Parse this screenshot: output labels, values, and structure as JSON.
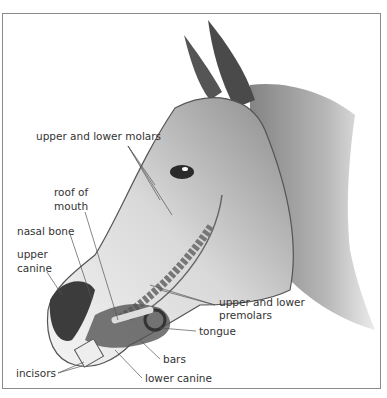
{
  "figure": {
    "labels": {
      "molars": "upper and lower molars",
      "roof_line1": "roof of",
      "roof_line2": "mouth",
      "nasal_bone": "nasal bone",
      "upper_canine_line1": "upper",
      "upper_canine_line2": "canine",
      "premolars_line1": "upper and lower",
      "premolars_line2": "premolars",
      "tongue": "tongue",
      "bars": "bars",
      "incisors": "incisors",
      "lower_canine": "lower canine"
    },
    "colors": {
      "frame": "#8a8a8a",
      "label_text": "#333333",
      "leader_line": "#555555"
    }
  }
}
